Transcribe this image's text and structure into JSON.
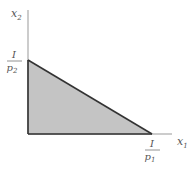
{
  "diagram": {
    "y_axis": {
      "label": "x",
      "subscript": "2"
    },
    "x_axis": {
      "label": "x",
      "subscript": "1"
    },
    "y_intercept": {
      "numerator": "I",
      "denominator": "p",
      "denominator_sub": "2"
    },
    "x_intercept": {
      "numerator": "I",
      "denominator": "p",
      "denominator_sub": "1"
    },
    "colors": {
      "fill": "#c4c4c4",
      "edge": "#333333",
      "axis": "#999999",
      "text": "#555555"
    }
  }
}
